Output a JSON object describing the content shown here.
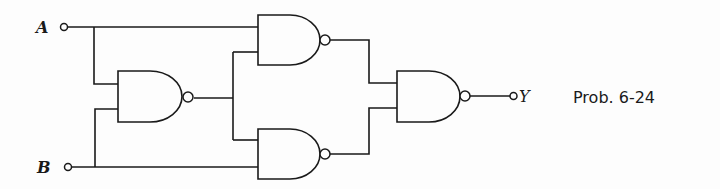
{
  "diagram": {
    "type": "logic-circuit",
    "gate_type": "NAND",
    "inputs": [
      {
        "label": "A"
      },
      {
        "label": "B"
      }
    ],
    "output": {
      "label": "Y"
    },
    "caption": "Prob. 6-24",
    "gates": [
      {
        "id": "G1",
        "type": "NAND",
        "inputs": [
          "A",
          "B"
        ]
      },
      {
        "id": "G2",
        "type": "NAND",
        "inputs": [
          "A",
          "G1"
        ]
      },
      {
        "id": "G3",
        "type": "NAND",
        "inputs": [
          "G1",
          "B"
        ]
      },
      {
        "id": "G4",
        "type": "NAND",
        "inputs": [
          "G2",
          "G3"
        ],
        "output": "Y"
      }
    ]
  }
}
